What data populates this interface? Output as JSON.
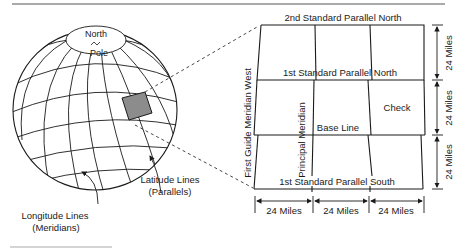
{
  "figure": {
    "type": "diagram",
    "globe": {
      "pole_label_line1": "North",
      "pole_label_line2": "Pole",
      "longitude_label_line1": "Longitude Lines",
      "longitude_label_line2": "(Meridians)",
      "latitude_label_line1": "Latitude Lines",
      "latitude_label_line2": "(Parallels)",
      "highlight_color": "#8c8c8c"
    },
    "survey_grid": {
      "top_parallel": "2nd Standard Parallel North",
      "upper_parallel": "1st Standard Parallel North",
      "base_line": "Base Line",
      "lower_parallel": "1st Standard Parallel South",
      "principal_meridian": "Principal Meridian",
      "guide_meridian": "First Guide Meridian West",
      "check_label": "Check",
      "right_dimensions": [
        "24 Miles",
        "24 Miles",
        "24 Miles"
      ],
      "bottom_dimensions": [
        "24 Miles",
        "24 Miles",
        "24 Miles"
      ]
    }
  }
}
